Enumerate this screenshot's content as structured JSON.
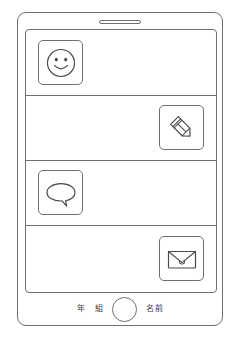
{
  "document": {
    "title": "Smartphone worksheet template",
    "kind": "printable-worksheet",
    "paper_color": "#ffffff",
    "ink_color": "#6f6f6f"
  },
  "device": {
    "speaker_slot": "speaker-slot",
    "home_button": "home-button"
  },
  "screen": {
    "rows": [
      {
        "index": 1,
        "icon": "smiley-face-icon",
        "icon_side": "left",
        "has_divider_below": true
      },
      {
        "index": 2,
        "icon": "pencil-icon",
        "icon_side": "right",
        "has_divider_below": true
      },
      {
        "index": 3,
        "icon": "speech-bubble-icon",
        "icon_side": "left",
        "has_divider_below": true
      },
      {
        "index": 4,
        "icon": "envelope-icon",
        "icon_side": "right",
        "has_divider_below": false
      }
    ]
  },
  "footer": {
    "year_label": "年",
    "class_label": "組",
    "name_label": "名前"
  }
}
